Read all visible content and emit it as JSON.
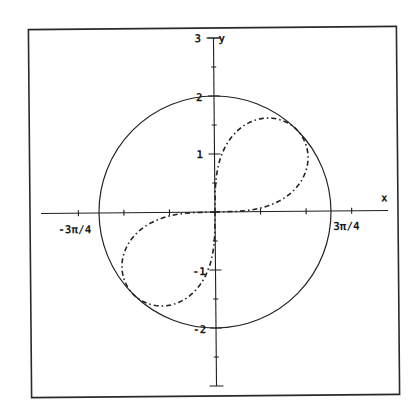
{
  "chart_data": {
    "type": "line",
    "title": "",
    "xlabel": "x",
    "ylabel": "y",
    "xlim": [
      -3.0,
      3.0
    ],
    "ylim": [
      -3,
      3
    ],
    "grid": false,
    "legend": null,
    "x_ticks": {
      "step_label": "π/4",
      "positions": [
        -2.356,
        -1.571,
        -0.785,
        0.785,
        1.571,
        2.356
      ],
      "labels": {
        "-2.356": "-3π/4",
        "2.356": "3π/4"
      }
    },
    "y_ticks": {
      "positions": [
        -2.5,
        -2,
        -1.5,
        -1,
        -0.5,
        0.5,
        1,
        1.5,
        2,
        2.5,
        3
      ],
      "labels": {
        "-2": "-2",
        "-1": "-1",
        "1": "1",
        "2": "2",
        "3": "3"
      }
    },
    "series": [
      {
        "name": "circle r = 2",
        "style": "solid",
        "radius": 2
      },
      {
        "name": "lemniscate r^2 = 4 sin(2θ)",
        "style": "dashed",
        "loop_q1": [
          [
            0,
            0
          ],
          [
            1.009,
            0.133
          ],
          [
            1.366,
            0.366
          ],
          [
            1.554,
            0.644
          ],
          [
            1.612,
            0.931
          ],
          [
            1.559,
            1.197
          ],
          [
            1.414,
            1.414
          ],
          [
            1.197,
            1.559
          ],
          [
            0.931,
            1.612
          ],
          [
            0.644,
            1.554
          ],
          [
            0.366,
            1.366
          ],
          [
            0.133,
            1.009
          ],
          [
            0,
            0
          ]
        ],
        "loop_q3": [
          [
            0,
            0
          ],
          [
            -1.009,
            -0.133
          ],
          [
            -1.366,
            -0.366
          ],
          [
            -1.554,
            -0.644
          ],
          [
            -1.612,
            -0.931
          ],
          [
            -1.559,
            -1.197
          ],
          [
            -1.414,
            -1.414
          ],
          [
            -1.197,
            -1.559
          ],
          [
            -0.931,
            -1.612
          ],
          [
            -0.644,
            -1.554
          ],
          [
            -0.366,
            -1.366
          ],
          [
            -0.133,
            -1.009
          ],
          [
            0,
            0
          ]
        ]
      }
    ]
  },
  "labels": {
    "x_axis": "x",
    "y_axis": "y",
    "y_top": "3",
    "y_2": "2",
    "y_1": "1",
    "y_m1": "-1",
    "y_m2": "-2",
    "x_left": "-3π/4",
    "x_right": "3π/4"
  }
}
